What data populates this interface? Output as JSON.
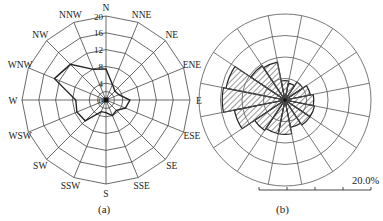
{
  "figure": {
    "captions": {
      "a": "(a)",
      "b": "(b)"
    },
    "scale_label": "20.0%"
  },
  "chart_data": [
    {
      "id": "a",
      "type": "radar",
      "title": "",
      "caption": "(a)",
      "directions": [
        "N",
        "NNE",
        "NE",
        "ENE",
        "E",
        "ESE",
        "SE",
        "SSE",
        "S",
        "SSW",
        "SW",
        "WSW",
        "W",
        "WNW",
        "NW",
        "NNW"
      ],
      "radial_ticks": [
        0,
        4,
        8,
        12,
        16,
        20
      ],
      "rmax": 20,
      "grid": "polygon",
      "series": [
        {
          "name": "frequency",
          "values": [
            7.4,
            4,
            3,
            3.3,
            5.7,
            5,
            3.5,
            4,
            3,
            3,
            7,
            7.5,
            7.2,
            13.3,
            12,
            7.9
          ]
        }
      ],
      "center": [
        106,
        100
      ],
      "radius_px": 84,
      "line_color": "#222222"
    },
    {
      "id": "b",
      "type": "rose",
      "title": "",
      "caption": "(b)",
      "directions": [
        "N",
        "NNE",
        "NE",
        "ENE",
        "E",
        "ESE",
        "SE",
        "SSE",
        "S",
        "SSW",
        "SW",
        "WSW",
        "W",
        "WNW",
        "NW",
        "NNW"
      ],
      "radial_ticks": [
        5,
        10,
        15,
        20
      ],
      "rmax": 20,
      "grid": "circle",
      "series": [
        {
          "name": "frequency (%)",
          "values": [
            4.5,
            4,
            5,
            6,
            6.7,
            7,
            7,
            6.5,
            8,
            8,
            8.5,
            12,
            14.6,
            14,
            9.6,
            9
          ]
        }
      ],
      "center": [
        285,
        100
      ],
      "radius_px": 86,
      "fill": "hatched",
      "scale_bar": {
        "label": "20.0%",
        "ticks": [
          0,
          5,
          10,
          15,
          20
        ]
      }
    }
  ]
}
